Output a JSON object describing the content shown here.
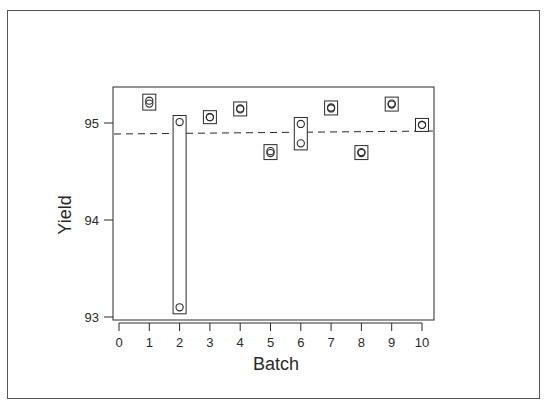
{
  "chart_data": {
    "type": "scatter",
    "title": "",
    "xlabel": "Batch",
    "ylabel": "Yield",
    "xlim": [
      0,
      10
    ],
    "ylim": [
      93,
      95.35
    ],
    "x_ticks": [
      0,
      1,
      2,
      3,
      4,
      5,
      6,
      7,
      8,
      9,
      10
    ],
    "y_ticks": [
      93,
      94,
      95
    ],
    "grid": false,
    "legend": null,
    "reference_line": {
      "style": "dashed",
      "y": 94.89,
      "description": "overall mean yield"
    },
    "series": [
      {
        "name": "Yield by batch",
        "marker": "open-circle",
        "boxed_range": true,
        "points": [
          {
            "batch": 1,
            "values": [
              95.23,
              95.2
            ]
          },
          {
            "batch": 2,
            "values": [
              95.01,
              93.1
            ]
          },
          {
            "batch": 3,
            "values": [
              95.06,
              95.06
            ]
          },
          {
            "batch": 4,
            "values": [
              95.15,
              95.14
            ]
          },
          {
            "batch": 5,
            "values": [
              94.71,
              94.69
            ]
          },
          {
            "batch": 6,
            "values": [
              94.99,
              94.79
            ]
          },
          {
            "batch": 7,
            "values": [
              95.16,
              95.15
            ]
          },
          {
            "batch": 8,
            "values": [
              94.7,
              94.69
            ]
          },
          {
            "batch": 9,
            "values": [
              95.2,
              95.19
            ]
          },
          {
            "batch": 10,
            "values": [
              94.98,
              94.98
            ]
          }
        ]
      }
    ]
  },
  "axes": {
    "xlabel": "Batch",
    "ylabel": "Yield",
    "x_tick_labels": [
      "0",
      "1",
      "2",
      "3",
      "4",
      "5",
      "6",
      "7",
      "8",
      "9",
      "10"
    ],
    "y_tick_labels": [
      "93",
      "94",
      "95"
    ]
  },
  "colors": {
    "ink": "#2a2a2a",
    "frame": "#555555",
    "background": "#ffffff"
  }
}
